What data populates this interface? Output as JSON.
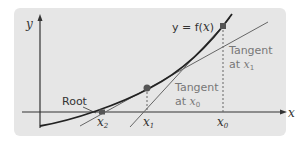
{
  "diagram": {
    "type": "newton-raphson-method",
    "axes": {
      "y_label": "y",
      "x_label": "x"
    },
    "curve": {
      "label_prefix": "y = f(",
      "label_var": "x",
      "label_suffix": ")"
    },
    "points": [
      {
        "label": "x",
        "sub": "0"
      },
      {
        "label": "x",
        "sub": "1"
      },
      {
        "label": "x",
        "sub": "2"
      }
    ],
    "annotations": {
      "root": "Root",
      "tangent_x1_line1": "Tangent",
      "tangent_x1_line2_prefix": "at ",
      "tangent_x1_var": "x",
      "tangent_x1_sub": "1",
      "tangent_x0_line1": "Tangent",
      "tangent_x0_line2_prefix": "at ",
      "tangent_x0_var": "x",
      "tangent_x0_sub": "0"
    },
    "colors": {
      "background": "#e6e6e6",
      "curve": "#222222",
      "tangent": "#666666",
      "points": "#555555",
      "dashed": "#666666"
    }
  }
}
